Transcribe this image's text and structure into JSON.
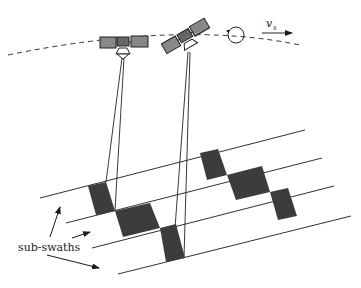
{
  "diagram": {
    "labels": {
      "velocity_symbol": "v",
      "velocity_subscript": "s",
      "subswaths": "sub-swaths"
    },
    "colors": {
      "line": "#1a1a1a",
      "patch": "#3c3c3c",
      "background": "#ffffff"
    },
    "nodes": [
      {
        "id": "satellite-1",
        "type": "satellite-icon"
      },
      {
        "id": "satellite-2",
        "type": "satellite-icon"
      },
      {
        "id": "rotation-indicator",
        "type": "circular-arrow-icon"
      },
      {
        "id": "velocity-arrow",
        "type": "arrow-icon"
      },
      {
        "id": "orbit-track",
        "type": "dashed-curve"
      },
      {
        "id": "swath-lines",
        "count": 4
      },
      {
        "id": "illuminated-patches",
        "count": 6
      }
    ]
  }
}
